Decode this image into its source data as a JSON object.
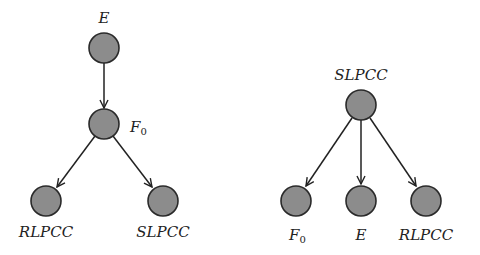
{
  "diagrams": [
    {
      "name": "left-graph",
      "nodes": [
        {
          "id": "E",
          "label": "E",
          "subscript": ""
        },
        {
          "id": "F0",
          "label": "F",
          "subscript": "0"
        },
        {
          "id": "RLPCC",
          "label": "RLPCC",
          "subscript": ""
        },
        {
          "id": "SLPCC",
          "label": "SLPCC",
          "subscript": ""
        }
      ],
      "edges": [
        [
          "E",
          "F0"
        ],
        [
          "F0",
          "RLPCC"
        ],
        [
          "F0",
          "SLPCC"
        ]
      ]
    },
    {
      "name": "right-graph",
      "nodes": [
        {
          "id": "SLPCC",
          "label": "SLPCC",
          "subscript": ""
        },
        {
          "id": "F0",
          "label": "F",
          "subscript": "0"
        },
        {
          "id": "E",
          "label": "E",
          "subscript": ""
        },
        {
          "id": "RLPCC",
          "label": "RLPCC",
          "subscript": ""
        }
      ],
      "edges": [
        [
          "SLPCC",
          "F0"
        ],
        [
          "SLPCC",
          "E"
        ],
        [
          "SLPCC",
          "RLPCC"
        ]
      ]
    }
  ],
  "colors": {
    "node_fill": "#8c8c8c",
    "node_stroke": "#2a2a2a",
    "edge": "#222222"
  }
}
